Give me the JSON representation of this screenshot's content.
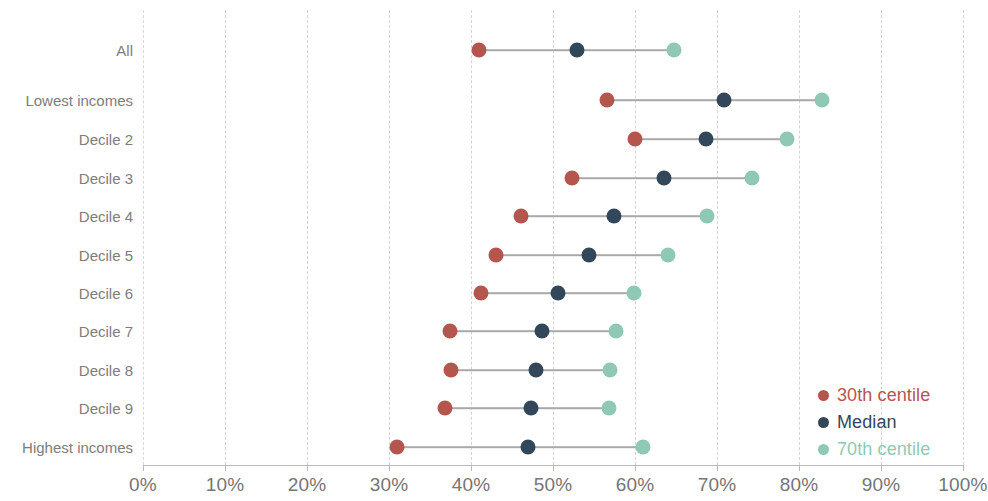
{
  "chart_data": {
    "type": "scatter",
    "subtype": "dumbbell-range-plot",
    "title": "",
    "xlabel": "",
    "ylabel": "",
    "xlim": [
      0,
      100
    ],
    "x_unit": "%",
    "grid": true,
    "grid_axis": "x",
    "legend_position": "bottom-right",
    "categories": [
      "All",
      "Lowest incomes",
      "Decile 2",
      "Decile 3",
      "Decile 4",
      "Decile 5",
      "Decile 6",
      "Decile 7",
      "Decile 8",
      "Decile 9",
      "Highest incomes"
    ],
    "series": [
      {
        "name": "30th centile",
        "color": "#b5564e",
        "values": [
          41.0,
          56.6,
          60.0,
          52.3,
          46.1,
          43.0,
          41.2,
          37.4,
          37.6,
          36.8,
          31.0
        ]
      },
      {
        "name": "Median",
        "color": "#33475b",
        "values": [
          52.9,
          70.9,
          68.7,
          63.5,
          57.4,
          54.4,
          50.6,
          48.7,
          47.9,
          47.3,
          47.0
        ]
      },
      {
        "name": "70th centile",
        "color": "#8fc9b6",
        "values": [
          64.8,
          82.8,
          78.5,
          74.3,
          68.8,
          64.0,
          59.9,
          57.7,
          56.9,
          56.8,
          61.0
        ]
      }
    ],
    "x_ticks": [
      {
        "value": 0,
        "label": "0%"
      },
      {
        "value": 10,
        "label": "10%"
      },
      {
        "value": 20,
        "label": "20%"
      },
      {
        "value": 30,
        "label": "30%"
      },
      {
        "value": 40,
        "label": "40%"
      },
      {
        "value": 50,
        "label": "50%"
      },
      {
        "value": 60,
        "label": "60%"
      },
      {
        "value": 70,
        "label": "70%"
      },
      {
        "value": 80,
        "label": "80%"
      },
      {
        "value": 90,
        "label": "90%"
      },
      {
        "value": 100,
        "label": "100%"
      }
    ],
    "row_y_px": [
      50,
      100,
      139,
      178,
      216,
      255,
      293,
      331,
      370,
      408,
      447
    ],
    "legend": [
      {
        "label": "30th centile",
        "color": "#b5564e"
      },
      {
        "label": "Median",
        "color": "#33475b"
      },
      {
        "label": "70th centile",
        "color": "#8fc9b6"
      }
    ],
    "colors": {
      "background": "#ffffff",
      "gridline": "#d4d4d4",
      "axis": "#b9b9b9",
      "connector": "#a9a9a9",
      "tick_label": "#757575",
      "category_label": "#7d7d7d"
    }
  }
}
